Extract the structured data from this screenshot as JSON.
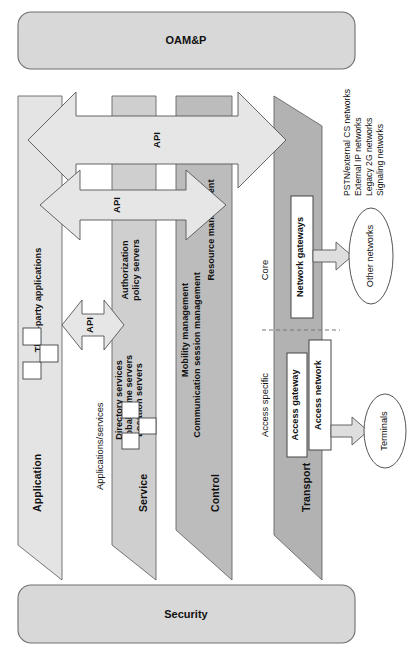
{
  "diagram": {
    "title_top": "OAM&P",
    "title_bottom": "Security",
    "type": "layered-network-architecture"
  },
  "bars": {
    "oamp": "OAM&P",
    "security": "Security"
  },
  "layers": [
    {
      "id": "application",
      "label": "Application",
      "items": [
        "Third-party applications"
      ],
      "fill": "#e4e4e4"
    },
    {
      "id": "service",
      "label": "Service",
      "items": [
        "Authorization\npolicy servers",
        "Directory services",
        "Global name servers",
        "Location servers"
      ],
      "fill": "#cfcfcf"
    },
    {
      "id": "control",
      "label": "Control",
      "items": [
        "Resource management",
        "Mobility management",
        "Communication session management"
      ],
      "fill": "#bcbcbc"
    },
    {
      "id": "transport",
      "label": "Transport",
      "items": [
        "Network gateways",
        "Access gateway",
        "Access network"
      ],
      "fill": "#b2b2b2"
    }
  ],
  "layer_labels": {
    "application": "Application",
    "service": "Service",
    "control": "Control",
    "transport": "Transport"
  },
  "application_layer": {
    "item_third_party": "Third-party applications",
    "node_cluster_name": "application-nodes"
  },
  "service_layer": {
    "item_authorization": "Authorization",
    "item_policy_servers": "policy servers",
    "item_directory": "Directory services",
    "item_global_name": "Global name servers",
    "item_location": "Location servers",
    "side_label": "Applications/services"
  },
  "control_layer": {
    "item_resource": "Resource management",
    "item_mobility": "Mobility management",
    "item_session": "Communication session management"
  },
  "transport_layer": {
    "zone_core": "Core",
    "zone_access": "Access specific",
    "box_network_gateways": "Network gateways",
    "box_access_gateway": "Access gateway",
    "box_access_network": "Access network"
  },
  "api_arrows": [
    {
      "id": "api-top",
      "label": "API"
    },
    {
      "id": "api-mid",
      "label": "API"
    },
    {
      "id": "api-left",
      "label": "API"
    }
  ],
  "external": {
    "networks_list": [
      "PSTN/external CS networks",
      "External IP networks",
      "Legacy 2G networks",
      "Signaling networks"
    ],
    "ellipse_other": "Other networks",
    "ellipse_terminals": "Terminals"
  },
  "colors": {
    "bar_fill": "#d8d8d8",
    "bar_stroke": "#6e6e6e",
    "app_fill": "#e4e4e4",
    "service_fill": "#cfcfcf",
    "control_fill": "#bcbcbc",
    "transport_fill": "#b2b2b2",
    "arrow_fill": "#e2e2e2",
    "arrow_stroke": "#555555",
    "box_fill": "#ffffff",
    "box_stroke": "#444444",
    "divider": "#777777",
    "text": "#111111"
  }
}
